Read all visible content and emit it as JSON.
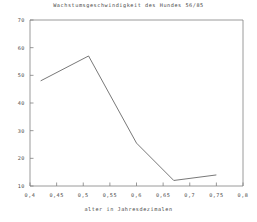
{
  "chart_data": {
    "type": "line",
    "title": "Wachstumsgeschwindigkeit des Hundes 56/85",
    "xlabel": "alter in Jahresdezimalen",
    "ylabel": "",
    "xlim": [
      0.4,
      0.8
    ],
    "ylim": [
      10,
      70
    ],
    "grid": false,
    "legend": null,
    "x_ticks": [
      "0,4",
      "0,45",
      "0,5",
      "0,55",
      "0,6",
      "0,65",
      "0,7",
      "0,75",
      "0,8"
    ],
    "x_tick_values": [
      0.4,
      0.45,
      0.5,
      0.55,
      0.6,
      0.65,
      0.7,
      0.75,
      0.8
    ],
    "y_ticks": [
      "10",
      "20",
      "30",
      "40",
      "50",
      "60",
      "70"
    ],
    "y_tick_values": [
      10,
      20,
      30,
      40,
      50,
      60,
      70
    ],
    "series": [
      {
        "name": "Wachstumsgeschwindigkeit",
        "color": "#555555",
        "x": [
          0.42,
          0.51,
          0.6,
          0.67,
          0.75
        ],
        "values": [
          48,
          57,
          25.5,
          12,
          14
        ]
      }
    ]
  },
  "axes": {
    "line_color": "#777777",
    "background": "#ffffff"
  }
}
